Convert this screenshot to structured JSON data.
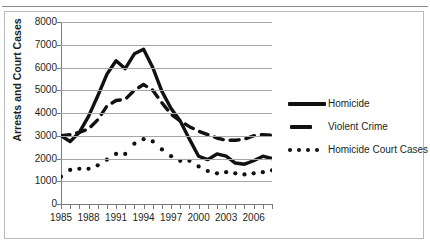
{
  "top_rule": {
    "cut_text": "g"
  },
  "chart_data": {
    "type": "line",
    "title": "",
    "xlabel": "",
    "ylabel": "Arrests and Court Cases",
    "ylim": [
      0,
      8000
    ],
    "xlim": [
      1985,
      2008
    ],
    "grid": true,
    "legend_position": "right",
    "ytick_labels": [
      "8000",
      "7000",
      "6000",
      "5000",
      "4000",
      "3000",
      "2000",
      "1000",
      "0"
    ],
    "ytick_values": [
      8000,
      7000,
      6000,
      5000,
      4000,
      3000,
      2000,
      1000,
      0
    ],
    "xtick_values": [
      1985,
      1986,
      1987,
      1988,
      1989,
      1990,
      1991,
      1992,
      1993,
      1994,
      1995,
      1996,
      1997,
      1998,
      1999,
      2000,
      2001,
      2002,
      2003,
      2004,
      2005,
      2006,
      2007,
      2008
    ],
    "xtick_labels": [
      "1985",
      "1988",
      "1991",
      "1994",
      "1997",
      "2000",
      "2003",
      "2006"
    ],
    "xtick_label_values": [
      1985,
      1988,
      1991,
      1994,
      1997,
      2000,
      2003,
      2006
    ],
    "x": [
      1985,
      1986,
      1987,
      1988,
      1989,
      1990,
      1991,
      1992,
      1993,
      1994,
      1995,
      1996,
      1997,
      1998,
      1999,
      2000,
      2001,
      2002,
      2003,
      2004,
      2005,
      2006,
      2007,
      2008
    ],
    "series": [
      {
        "name": "Homicide",
        "style": "solid",
        "color": "#111111",
        "values": [
          3000,
          2750,
          3150,
          3850,
          4750,
          5700,
          6300,
          5950,
          6600,
          6800,
          6000,
          4950,
          4200,
          3650,
          2850,
          2100,
          1950,
          2200,
          2100,
          1800,
          1750,
          1900,
          2100,
          2000
        ]
      },
      {
        "name": "Violent Crime",
        "style": "dashed",
        "color": "#111111",
        "values": [
          3000,
          3050,
          3150,
          3300,
          3700,
          4300,
          4550,
          4600,
          5000,
          5250,
          5000,
          4450,
          3950,
          3650,
          3400,
          3200,
          3050,
          2900,
          2800,
          2800,
          2850,
          3000,
          3050,
          3020
        ]
      },
      {
        "name": "Homicide Court Cases",
        "style": "dotted",
        "color": "#111111",
        "values": [
          1200,
          1500,
          1550,
          1550,
          1700,
          1950,
          2200,
          2200,
          2650,
          2850,
          2750,
          2400,
          2100,
          1900,
          1900,
          1650,
          1450,
          1350,
          1400,
          1350,
          1300,
          1350,
          1400,
          1480
        ]
      }
    ]
  },
  "legend": {
    "items": [
      {
        "label": "Homicide",
        "key": "solid-line-key"
      },
      {
        "label": "Violent Crime",
        "key": "dashed-line-key"
      },
      {
        "label": "Homicide Court Cases",
        "key": "dotted-line-key"
      }
    ]
  }
}
